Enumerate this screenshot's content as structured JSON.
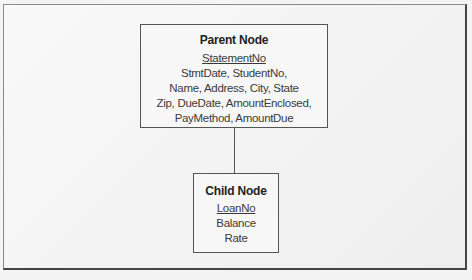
{
  "diagram": {
    "parent": {
      "title": "Parent Node",
      "key": "StatementNo",
      "attributes": [
        "StmtDate, StudentNo,",
        "Name, Address, City, State",
        "Zip, DueDate, AmountEnclosed,",
        "PayMethod, AmountDue"
      ]
    },
    "child": {
      "title": "Child Node",
      "key": "LoanNo",
      "attributes": [
        "Balance",
        "Rate"
      ]
    }
  }
}
